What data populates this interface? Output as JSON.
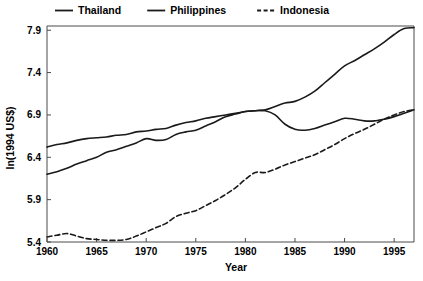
{
  "chart_data": {
    "type": "line",
    "title": "",
    "xlabel": "Year",
    "ylabel": "ln(1994 US$)",
    "xlim": [
      1960,
      1997
    ],
    "ylim": [
      5.4,
      7.95
    ],
    "xticks": [
      1960,
      1965,
      1970,
      1975,
      1980,
      1985,
      1990,
      1995
    ],
    "yticks": [
      5.4,
      5.9,
      6.4,
      6.9,
      7.4,
      7.9
    ],
    "xtick_labels": [
      "1960",
      "1965",
      "1970",
      "1975",
      "1980",
      "1985",
      "1990",
      "1995"
    ],
    "ytick_labels": [
      "5.4",
      "5.9",
      "6.4",
      "6.9",
      "7.4",
      "7.9"
    ],
    "grid": false,
    "legend_position": "top",
    "x": [
      1960,
      1961,
      1962,
      1963,
      1964,
      1965,
      1966,
      1967,
      1968,
      1969,
      1970,
      1971,
      1972,
      1973,
      1974,
      1975,
      1976,
      1977,
      1978,
      1979,
      1980,
      1981,
      1982,
      1983,
      1984,
      1985,
      1986,
      1987,
      1988,
      1989,
      1990,
      1991,
      1992,
      1993,
      1994,
      1995,
      1996,
      1997
    ],
    "series": [
      {
        "name": "Thailand",
        "style": "solid",
        "color": "#1a1a1a",
        "values": [
          6.2,
          6.23,
          6.27,
          6.32,
          6.36,
          6.4,
          6.46,
          6.49,
          6.53,
          6.57,
          6.62,
          6.6,
          6.61,
          6.67,
          6.7,
          6.72,
          6.77,
          6.82,
          6.88,
          6.91,
          6.94,
          6.95,
          6.96,
          7.0,
          7.04,
          7.06,
          7.11,
          7.18,
          7.28,
          7.38,
          7.48,
          7.54,
          7.61,
          7.68,
          7.76,
          7.85,
          7.92,
          7.93
        ]
      },
      {
        "name": "Philippines",
        "style": "solid",
        "color": "#1a1a1a",
        "values": [
          6.52,
          6.55,
          6.57,
          6.6,
          6.62,
          6.63,
          6.64,
          6.66,
          6.67,
          6.7,
          6.71,
          6.73,
          6.74,
          6.78,
          6.81,
          6.83,
          6.86,
          6.88,
          6.9,
          6.92,
          6.94,
          6.95,
          6.95,
          6.9,
          6.79,
          6.73,
          6.72,
          6.74,
          6.78,
          6.82,
          6.86,
          6.85,
          6.83,
          6.83,
          6.85,
          6.88,
          6.92,
          6.96
        ]
      },
      {
        "name": "Indonesia",
        "style": "dashed",
        "color": "#1a1a1a",
        "values": [
          5.46,
          5.48,
          5.5,
          5.47,
          5.44,
          5.43,
          5.42,
          5.42,
          5.43,
          5.47,
          5.52,
          5.57,
          5.62,
          5.7,
          5.74,
          5.77,
          5.83,
          5.89,
          5.96,
          6.04,
          6.14,
          6.22,
          6.22,
          6.26,
          6.31,
          6.35,
          6.39,
          6.43,
          6.49,
          6.55,
          6.62,
          6.68,
          6.73,
          6.79,
          6.85,
          6.9,
          6.94,
          6.96
        ]
      }
    ]
  },
  "legend": {
    "items": [
      {
        "label": "Thailand",
        "style": "solid"
      },
      {
        "label": "Philippines",
        "style": "solid"
      },
      {
        "label": "Indonesia",
        "style": "dashed"
      }
    ]
  },
  "axes": {
    "x_title": "Year",
    "y_title": "ln(1994 US$)"
  }
}
